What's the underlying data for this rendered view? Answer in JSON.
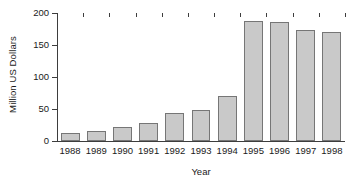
{
  "chart_data": {
    "type": "bar",
    "title": "",
    "xlabel": "Year",
    "ylabel": "Million US Dollars",
    "categories": [
      "1988",
      "1989",
      "1990",
      "1991",
      "1992",
      "1993",
      "1994",
      "1995",
      "1996",
      "1997",
      "1998"
    ],
    "values": [
      12,
      16,
      22,
      28,
      44,
      48,
      71,
      187,
      186,
      173,
      171
    ],
    "ylim": [
      0,
      200
    ],
    "yticks": [
      0,
      50,
      100,
      150,
      200
    ],
    "ytick_labels": [
      "0",
      "50",
      "100",
      "150",
      "200"
    ],
    "grid": false,
    "legend": null,
    "series": [
      {
        "name": "Million US Dollars",
        "values": [
          12,
          16,
          22,
          28,
          44,
          48,
          71,
          187,
          186,
          173,
          171
        ]
      }
    ],
    "bar_fill_color": "#c9c9c9",
    "bar_edge_color": "#767676",
    "axis_color": "#3d3d3d",
    "background_color": "#ffffff"
  }
}
